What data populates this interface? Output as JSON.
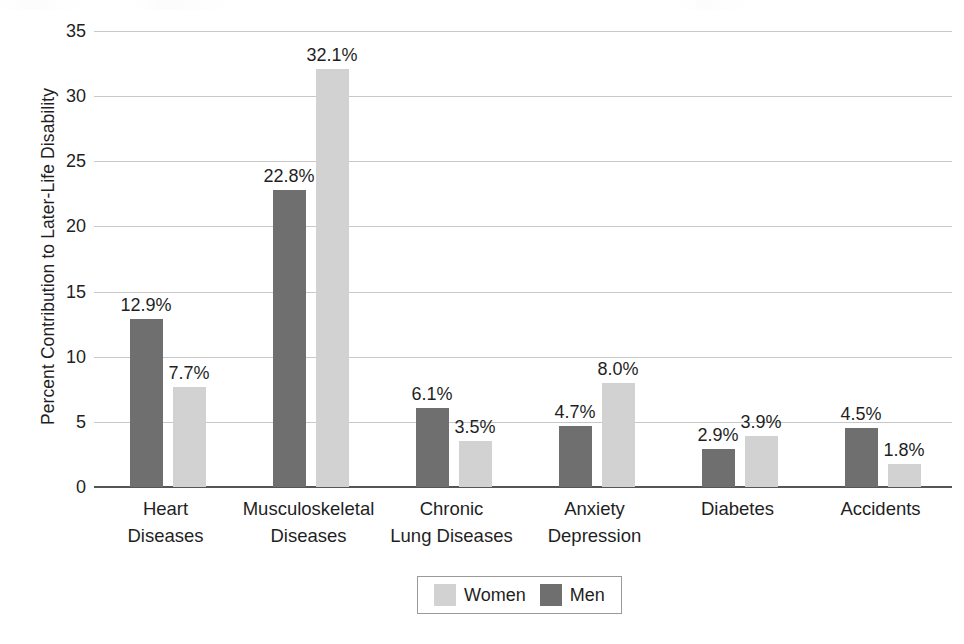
{
  "chart_data": {
    "type": "bar",
    "title": "",
    "xlabel": "",
    "ylabel": "Percent Contribution to Later-Life Disability",
    "ylim": [
      0,
      35
    ],
    "ytick_labels": [
      "35",
      "30",
      "25",
      "20",
      "15",
      "10",
      "5",
      "0"
    ],
    "ytick_values": [
      35,
      30,
      25,
      20,
      15,
      10,
      5,
      0
    ],
    "grid": true,
    "legend_position": "bottom-center",
    "categories": [
      "Heart Diseases",
      "Musculoskeletal Diseases",
      "Chronic Lung Diseases",
      "Anxiety Depression",
      "Diabetes",
      "Accidents"
    ],
    "category_lines": [
      [
        "Heart",
        "Diseases"
      ],
      [
        "Musculoskeletal",
        "Diseases"
      ],
      [
        "Chronic",
        "Lung Diseases"
      ],
      [
        "Anxiety",
        "Depression"
      ],
      [
        "Diabetes",
        ""
      ],
      [
        "Accidents",
        ""
      ]
    ],
    "series": [
      {
        "name": "Men",
        "color": "#6f6f6f",
        "values": [
          12.9,
          22.8,
          6.1,
          4.7,
          2.9,
          4.5
        ],
        "labels": [
          "12.9%",
          "22.8%",
          "6.1%",
          "4.7%",
          "2.9%",
          "4.5%"
        ]
      },
      {
        "name": "Women",
        "color": "#d2d2d2",
        "values": [
          7.7,
          32.1,
          3.5,
          8.0,
          3.9,
          1.8
        ],
        "labels": [
          "7.7%",
          "32.1%",
          "3.5%",
          "8.0%",
          "3.9%",
          "1.8%"
        ]
      }
    ]
  },
  "legend": {
    "items": [
      {
        "label": "Women",
        "swatch": "women-swatch"
      },
      {
        "label": "Men",
        "swatch": "men-swatch"
      }
    ]
  }
}
